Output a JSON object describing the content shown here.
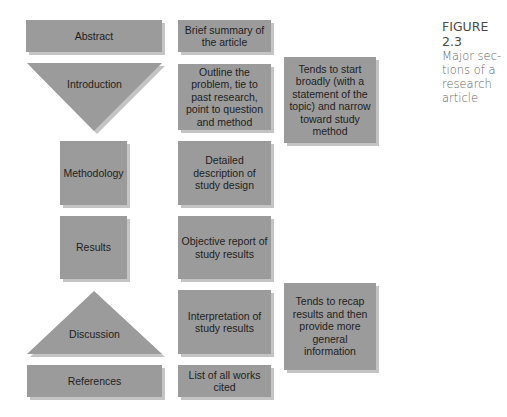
{
  "colors": {
    "box_fill": "#9b9b9b",
    "box_shadow": "#c4c4c4",
    "text": "#1e1e1e",
    "caption_text": "#555555"
  },
  "caption": {
    "figure_label": "FIGURE 2.3",
    "description_lines": [
      "Major sec-",
      "tions of a",
      "research",
      "article"
    ]
  },
  "sections": [
    {
      "id": "abstract",
      "label": "Abstract",
      "shape": "rectangle",
      "description": "Brief summary of the article",
      "note": null
    },
    {
      "id": "introduction",
      "label": "Introduction",
      "shape": "inverted-triangle",
      "description": "Outline the problem, tie to past research, point to question and method",
      "note": "Tends to start broadly (with a statement of the topic) and narrow toward study method"
    },
    {
      "id": "methodology",
      "label": "Methodology",
      "shape": "square",
      "description": "Detailed description of study design",
      "note": null
    },
    {
      "id": "results",
      "label": "Results",
      "shape": "square",
      "description": "Objective report of study results",
      "note": null
    },
    {
      "id": "discussion",
      "label": "Discussion",
      "shape": "triangle",
      "description": "Interpretation of study results",
      "note": "Tends to recap results and then provide more general information"
    },
    {
      "id": "references",
      "label": "References",
      "shape": "rectangle",
      "description": "List of all works cited",
      "note": null
    }
  ]
}
